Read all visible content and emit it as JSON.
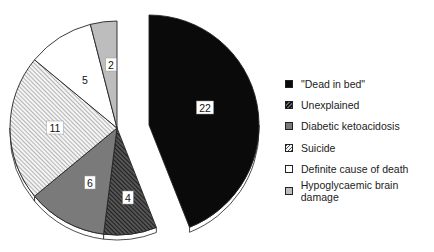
{
  "chart_data": {
    "type": "pie",
    "title": "",
    "total": 50,
    "slices": [
      {
        "label": "\"Dead in bed\"",
        "value": 22,
        "fill": "#0a0a0a",
        "pattern": "solid",
        "exploded": true
      },
      {
        "label": "Unexplained",
        "value": 4,
        "fill": "#333333",
        "pattern": "dense-diagonal-dark"
      },
      {
        "label": "Diabetic ketoacidosis",
        "value": 6,
        "fill": "#7a7a7a",
        "pattern": "solid"
      },
      {
        "label": "Suicide",
        "value": 11,
        "fill": "#dcdcdc",
        "pattern": "diagonal-light"
      },
      {
        "label": "Definite cause of death",
        "value": 5,
        "fill": "#ffffff",
        "pattern": "solid"
      },
      {
        "label": "Hypoglycaemic brain damage",
        "value": 2,
        "fill": "#bdbdbd",
        "pattern": "solid"
      }
    ],
    "legend_position": "right",
    "start_angle_deg": -90,
    "direction": "clockwise"
  },
  "legend": {
    "items": [
      {
        "label": "\"Dead in bed\""
      },
      {
        "label": "Unexplained"
      },
      {
        "label": "Diabetic ketoacidosis"
      },
      {
        "label": "Suicide"
      },
      {
        "label": "Definite cause of death"
      },
      {
        "label": "Hypoglycaemic brain damage"
      }
    ]
  }
}
